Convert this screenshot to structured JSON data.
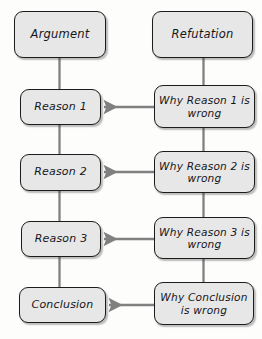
{
  "diagram": {
    "style": {
      "background_color": "#fdfdfc",
      "node_fill_color": "#e7e7e7",
      "node_border_color": "#1c1c1c",
      "connector_color": "#7d7d7d",
      "text_color": "#16161a"
    },
    "columns": [
      {
        "name": "argument-column",
        "heading": "Argument"
      },
      {
        "name": "refutation-column",
        "heading": "Refutation"
      }
    ],
    "nodes": [
      {
        "id": "argument",
        "label": "Argument",
        "column": "left",
        "x": 14,
        "y": 11,
        "w": 92,
        "h": 47,
        "size": "lg"
      },
      {
        "id": "refutation",
        "label": "Refutation",
        "column": "right",
        "x": 152,
        "y": 11,
        "w": 101,
        "h": 47,
        "size": "lg"
      },
      {
        "id": "reason-1",
        "label": "Reason 1",
        "column": "left",
        "x": 20,
        "y": 89,
        "w": 81,
        "h": 36,
        "size": "md"
      },
      {
        "id": "why-reason-1-wrong",
        "label": "Why Reason 1 is wrong",
        "column": "right",
        "x": 154,
        "y": 85,
        "w": 101,
        "h": 43,
        "size": "sm"
      },
      {
        "id": "reason-2",
        "label": "Reason 2",
        "column": "left",
        "x": 20,
        "y": 154,
        "w": 81,
        "h": 37,
        "size": "md"
      },
      {
        "id": "why-reason-2-wrong",
        "label": "Why Reason 2 is wrong",
        "column": "right",
        "x": 154,
        "y": 151,
        "w": 101,
        "h": 42,
        "size": "sm"
      },
      {
        "id": "reason-3",
        "label": "Reason 3",
        "column": "left",
        "x": 21,
        "y": 221,
        "w": 80,
        "h": 36,
        "size": "md"
      },
      {
        "id": "why-reason-3-wrong",
        "label": "Why Reason 3 is wrong",
        "column": "right",
        "x": 154,
        "y": 217,
        "w": 101,
        "h": 42,
        "size": "sm"
      },
      {
        "id": "conclusion",
        "label": "Conclusion",
        "column": "left",
        "x": 19,
        "y": 287,
        "w": 87,
        "h": 36,
        "size": "md"
      },
      {
        "id": "why-conclusion-wrong",
        "label": "Why Conclusion is wrong",
        "column": "right",
        "x": 154,
        "y": 282,
        "w": 100,
        "h": 43,
        "size": "sm"
      }
    ],
    "connectors": [
      {
        "name": "argument-to-reason-1",
        "kind": "vertical",
        "from": "argument",
        "to": "reason-1"
      },
      {
        "name": "reason-1-to-reason-2",
        "kind": "vertical",
        "from": "reason-1",
        "to": "reason-2"
      },
      {
        "name": "reason-2-to-reason-3",
        "kind": "vertical",
        "from": "reason-2",
        "to": "reason-3"
      },
      {
        "name": "reason-3-to-conclusion",
        "kind": "vertical",
        "from": "reason-3",
        "to": "conclusion"
      },
      {
        "name": "refutation-to-why-reason-1",
        "kind": "vertical",
        "from": "refutation",
        "to": "why-reason-1-wrong"
      },
      {
        "name": "why-reason-1-to-why-reason-2",
        "kind": "vertical",
        "from": "why-reason-1-wrong",
        "to": "why-reason-2-wrong"
      },
      {
        "name": "why-reason-2-to-why-reason-3",
        "kind": "vertical",
        "from": "why-reason-2-wrong",
        "to": "why-reason-3-wrong"
      },
      {
        "name": "why-reason-3-to-why-conclusion",
        "kind": "vertical",
        "from": "why-reason-3-wrong",
        "to": "why-conclusion-wrong"
      },
      {
        "name": "why-reason-1-arrow-to-reason-1",
        "kind": "arrow-left",
        "from": "why-reason-1-wrong",
        "to": "reason-1"
      },
      {
        "name": "why-reason-2-arrow-to-reason-2",
        "kind": "arrow-left",
        "from": "why-reason-2-wrong",
        "to": "reason-2"
      },
      {
        "name": "why-reason-3-arrow-to-reason-3",
        "kind": "arrow-left",
        "from": "why-reason-3-wrong",
        "to": "reason-3"
      },
      {
        "name": "why-conclusion-arrow-to-conclusion",
        "kind": "arrow-left",
        "from": "why-conclusion-wrong",
        "to": "conclusion"
      }
    ]
  }
}
